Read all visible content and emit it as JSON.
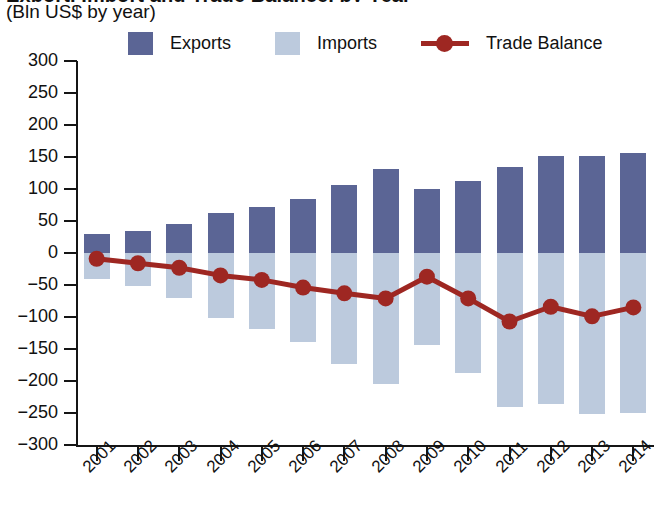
{
  "header": {
    "title_clipped": "Export, Import and Trade Balance, by Year",
    "subtitle": "(Bln US$ by year)"
  },
  "legend": {
    "items": [
      {
        "label": "Exports",
        "marker": "square-swatch",
        "color": "#5b6595"
      },
      {
        "label": "Imports",
        "marker": "square-swatch",
        "color": "#bccadd"
      },
      {
        "label": "Trade Balance",
        "marker": "line-with-dot",
        "color": "#9e2722"
      }
    ]
  },
  "axes": {
    "y_ticks": [
      300,
      250,
      200,
      150,
      100,
      50,
      0,
      -50,
      -100,
      -150,
      -200,
      -250,
      -300
    ],
    "y_tick_labels": [
      "300",
      "250",
      "200",
      "150",
      "100",
      "50",
      "0",
      "−50",
      "−100",
      "−150",
      "−200",
      "−250",
      "−300"
    ],
    "y_min": -300,
    "y_max": 300,
    "x_labels": [
      "2001",
      "2002",
      "2003",
      "2004",
      "2005",
      "2006",
      "2007",
      "2008",
      "2009",
      "2010",
      "2011",
      "2012",
      "2013",
      "2014"
    ]
  },
  "colors": {
    "exports": "#5b6595",
    "imports": "#bccadd",
    "trade_balance": "#9e2722",
    "axis": "#151515",
    "background": "#ffffff"
  },
  "chart_data": {
    "type": "bar",
    "title": "Export, Import and Trade Balance, by Year",
    "subtitle": "(Bln US$ by year)",
    "xlabel": "",
    "ylabel": "Bln US$ by year",
    "ylim": [
      -300,
      300
    ],
    "ytick_step": 50,
    "grid": false,
    "legend_position": "top",
    "categories": [
      "2001",
      "2002",
      "2003",
      "2004",
      "2005",
      "2006",
      "2007",
      "2008",
      "2009",
      "2010",
      "2011",
      "2012",
      "2013",
      "2014"
    ],
    "series": [
      {
        "name": "Exports",
        "type": "bar",
        "color": "#5b6595",
        "values": [
          30,
          34,
          46,
          62,
          72,
          84,
          106,
          131,
          100,
          112,
          134,
          152,
          151,
          156
        ]
      },
      {
        "name": "Imports",
        "type": "bar",
        "color": "#bccadd",
        "values": [
          -41,
          -52,
          -70,
          -102,
          -118,
          -139,
          -174,
          -204,
          -144,
          -188,
          -240,
          -236,
          -252,
          -250
        ]
      },
      {
        "name": "Trade Balance",
        "type": "line",
        "color": "#9e2722",
        "values": [
          -9,
          -16,
          -23,
          -35,
          -42,
          -54,
          -63,
          -71,
          -37,
          -71,
          -107,
          -84,
          -99,
          -85
        ]
      }
    ]
  }
}
